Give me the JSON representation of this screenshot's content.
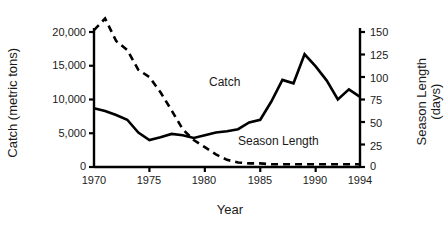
{
  "chart_data": {
    "type": "line",
    "title": "",
    "xlabel": "Year",
    "x": [
      1970,
      1971,
      1972,
      1973,
      1974,
      1975,
      1976,
      1977,
      1978,
      1979,
      1980,
      1981,
      1982,
      1983,
      1984,
      1985,
      1986,
      1987,
      1988,
      1989,
      1990,
      1991,
      1992,
      1993,
      1994
    ],
    "xlim": [
      1970,
      1994
    ],
    "xticks": [
      1970,
      1975,
      1980,
      1985,
      1990,
      1994
    ],
    "xtick_labels": [
      "1970",
      "1975",
      "1980",
      "1985",
      "1990",
      "1994"
    ],
    "grid": false,
    "legend_position": "inline-annotations",
    "axes": [
      {
        "id": "left",
        "label": "Catch (metric tons)",
        "ylim": [
          0,
          20000
        ],
        "yticks": [
          0,
          5000,
          10000,
          15000,
          20000
        ],
        "ytick_labels": [
          "0",
          "5,000",
          "10,000",
          "15,000",
          "20,000"
        ]
      },
      {
        "id": "right",
        "label": "Season Length (days)",
        "label_line1": "Season Length",
        "label_line2": "(days)",
        "ylim": [
          0,
          150
        ],
        "yticks": [
          0,
          25,
          50,
          75,
          100,
          125,
          150
        ],
        "ytick_labels": [
          "0",
          "25",
          "50",
          "75",
          "100",
          "125",
          "150"
        ]
      }
    ],
    "series": [
      {
        "name": "Catch",
        "axis": "left",
        "style": "solid",
        "color": "#000000",
        "annotation": "Catch",
        "units": "metric tons",
        "values": [
          8700,
          8300,
          7700,
          7000,
          5100,
          4000,
          4400,
          4900,
          4700,
          4300,
          4700,
          5100,
          5300,
          5600,
          6600,
          7000,
          9700,
          12900,
          12400,
          16700,
          14900,
          12800,
          10000,
          11500,
          10400
        ]
      },
      {
        "name": "Season Length",
        "axis": "right",
        "style": "dashed",
        "color": "#000000",
        "annotation": "Season Length",
        "units": "days",
        "values": [
          152,
          165,
          140,
          130,
          108,
          100,
          83,
          63,
          42,
          30,
          22,
          14,
          8,
          5,
          4,
          4,
          3,
          3,
          3,
          3,
          3,
          3,
          3,
          3,
          3
        ]
      }
    ]
  }
}
